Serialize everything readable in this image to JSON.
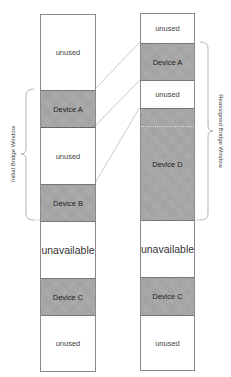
{
  "diagram": {
    "left_column": {
      "label": "Initial Bridge Window",
      "blocks": [
        {
          "label": "unused",
          "type": "free"
        },
        {
          "label": "Device A",
          "type": "device"
        },
        {
          "label": "unused",
          "type": "free"
        },
        {
          "label": "Device B",
          "type": "device"
        },
        {
          "label": "unavailable",
          "type": "unavailable"
        },
        {
          "label": "Device C",
          "type": "device"
        },
        {
          "label": "unused",
          "type": "free"
        }
      ]
    },
    "right_column": {
      "label": "Reassigned Bridge Window",
      "blocks": [
        {
          "label": "unused",
          "type": "free"
        },
        {
          "label": "Device A",
          "type": "device"
        },
        {
          "label": "unused",
          "type": "free"
        },
        {
          "label": "Device D",
          "type": "device"
        },
        {
          "label": "unavailable",
          "type": "unavailable"
        },
        {
          "label": "Device C",
          "type": "device"
        },
        {
          "label": "unused",
          "type": "free"
        }
      ]
    },
    "colors": {
      "device_fill": "#a9a9a9",
      "border": "#8a8a8a",
      "connector": "#b0b0b0",
      "background": "#ffffff"
    }
  }
}
